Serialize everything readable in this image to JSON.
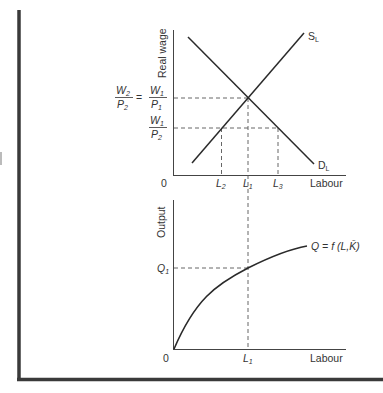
{
  "figure": {
    "frame_color": "#3a3a3a",
    "line_color": "#2a2a2a",
    "dash_color": "#555555"
  },
  "top_chart": {
    "y_axis_label": "Real wage",
    "x_axis_label": "Labour",
    "origin_label": "0",
    "supply_curve_label": "S",
    "supply_curve_sub": "L",
    "demand_curve_label": "D",
    "demand_curve_sub": "L",
    "y_ticks": [
      {
        "label": "W2/P2 = W1/P1",
        "num_left": "W",
        "num_left_sub": "2",
        "den_left": "P",
        "den_left_sub": "2",
        "eq": "=",
        "num_right": "W",
        "num_right_sub": "1",
        "den_right": "P",
        "den_right_sub": "1"
      },
      {
        "label": "W1/P2",
        "num": "W",
        "num_sub": "1",
        "den": "P",
        "den_sub": "2"
      }
    ],
    "x_ticks": [
      {
        "main": "L",
        "sub": "2"
      },
      {
        "main": "L",
        "sub": "1"
      },
      {
        "main": "L",
        "sub": "3"
      }
    ]
  },
  "bottom_chart": {
    "y_axis_label": "Output",
    "x_axis_label": "Labour",
    "origin_label": "0",
    "y_tick": {
      "main": "Q",
      "sub": "1"
    },
    "x_tick": {
      "main": "L",
      "sub": "1"
    },
    "curve_label": "Q = f (L,K̄)"
  }
}
